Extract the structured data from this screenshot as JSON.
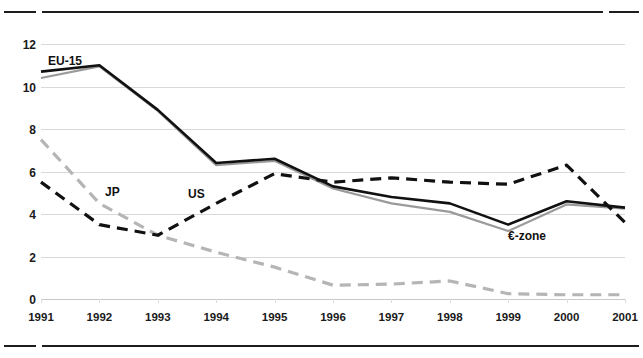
{
  "figure": {
    "has_top_rule": true,
    "has_bottom_rule": true,
    "background": "#ffffff"
  },
  "series_labels": {
    "eu15": "EU-15",
    "jp": "JP",
    "us": "US",
    "ezone": "€-zone"
  },
  "colors": {
    "eu15": "#111111",
    "ezone": "#9a9a9a",
    "us": "#111111",
    "jp": "#b5b5b5",
    "gridline": "#d9d9d9",
    "rule": "#1d1d1d",
    "text": "#1a1a1a"
  },
  "chart_data": {
    "type": "line",
    "title": "",
    "xlabel": "",
    "ylabel": "",
    "xlim": [
      1991,
      2001
    ],
    "ylim": [
      0,
      12
    ],
    "yticks": [
      0,
      2,
      4,
      6,
      8,
      10,
      12
    ],
    "grid": true,
    "legend": "inline-annotations",
    "categories": [
      "1991",
      "1992",
      "1993",
      "1994",
      "1995",
      "1996",
      "1997",
      "1998",
      "1999",
      "2000",
      "2001"
    ],
    "x": [
      1991,
      1992,
      1993,
      1994,
      1995,
      1996,
      1997,
      1998,
      1999,
      2000,
      2001
    ],
    "series": [
      {
        "name": "EU-15",
        "style": "solid",
        "color": "#111111",
        "values": [
          10.7,
          11.0,
          8.9,
          6.4,
          6.6,
          5.3,
          4.8,
          4.5,
          3.5,
          4.6,
          4.3
        ]
      },
      {
        "name": "€-zone",
        "style": "solid",
        "color": "#9a9a9a",
        "values": [
          10.4,
          10.95,
          8.85,
          6.3,
          6.5,
          5.2,
          4.5,
          4.1,
          3.2,
          4.45,
          4.25
        ]
      },
      {
        "name": "US",
        "style": "dashed",
        "color": "#111111",
        "values": [
          5.5,
          3.5,
          3.0,
          4.5,
          5.9,
          5.5,
          5.7,
          5.5,
          5.4,
          6.3,
          3.6
        ]
      },
      {
        "name": "JP",
        "style": "dashed",
        "color": "#b5b5b5",
        "values": [
          7.5,
          4.5,
          3.0,
          2.2,
          1.5,
          0.65,
          0.7,
          0.85,
          0.25,
          0.2,
          0.2
        ]
      }
    ]
  }
}
